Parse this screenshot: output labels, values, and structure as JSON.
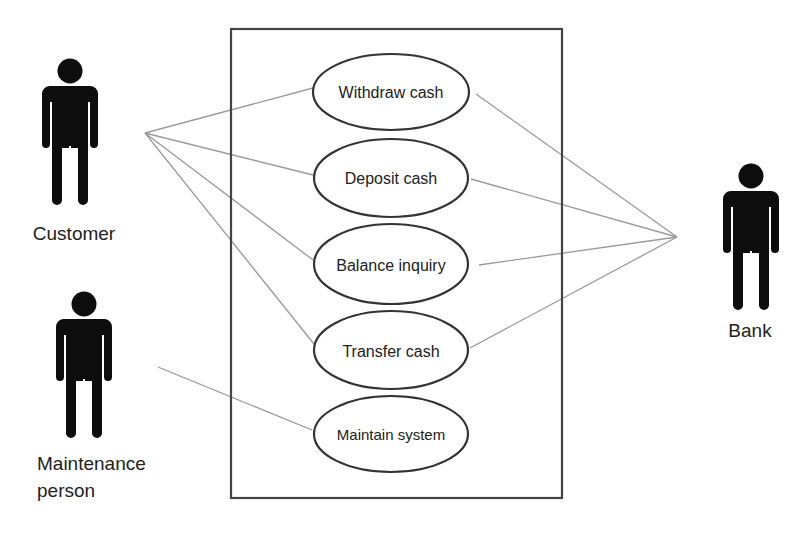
{
  "diagram": {
    "type": "UML use case diagram",
    "system_boundary": {
      "x": 231,
      "y": 29,
      "width": 331,
      "height": 469
    },
    "colors": {
      "boundary": "#444444",
      "ellipse_stroke": "#333333",
      "association_line": "#9a9a9a",
      "actor_fill": "#0d0d0d",
      "text": "#222222"
    },
    "actors": [
      {
        "id": "customer",
        "label": "Customer",
        "icon": "person-icon"
      },
      {
        "id": "maintenance",
        "label_line1": "Maintenance",
        "label_line2": "person",
        "icon": "person-icon"
      },
      {
        "id": "bank",
        "label": "Bank",
        "icon": "person-icon"
      }
    ],
    "use_cases": [
      {
        "id": "withdraw",
        "label": "Withdraw cash"
      },
      {
        "id": "deposit",
        "label": "Deposit cash"
      },
      {
        "id": "balance",
        "label": "Balance inquiry"
      },
      {
        "id": "transfer",
        "label": "Transfer cash"
      },
      {
        "id": "maintain",
        "label": "Maintain system"
      }
    ],
    "associations": [
      {
        "actor": "Customer",
        "use_case": "Withdraw cash"
      },
      {
        "actor": "Customer",
        "use_case": "Deposit cash"
      },
      {
        "actor": "Customer",
        "use_case": "Balance inquiry"
      },
      {
        "actor": "Customer",
        "use_case": "Transfer cash"
      },
      {
        "actor": "Maintenance person",
        "use_case": "Maintain system"
      },
      {
        "actor": "Bank",
        "use_case": "Withdraw cash"
      },
      {
        "actor": "Bank",
        "use_case": "Deposit cash"
      },
      {
        "actor": "Bank",
        "use_case": "Balance inquiry"
      },
      {
        "actor": "Bank",
        "use_case": "Transfer cash"
      }
    ]
  }
}
